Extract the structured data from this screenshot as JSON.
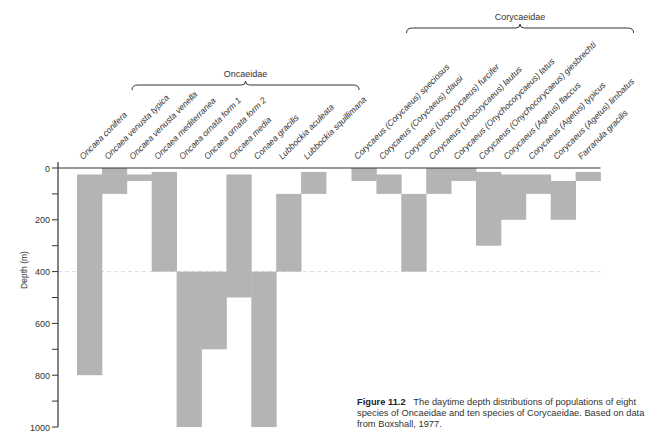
{
  "figure": {
    "number": "Figure 11.2",
    "caption": "The daytime depth distributions of populations of eight species of Oncaeidae and ten species of Corycaeidae. Based on data from Boxshall, 1977."
  },
  "colors": {
    "bar": "#b4b4b4",
    "axis": "#333333",
    "dashed_ref": "#dddddd"
  },
  "chart_data": {
    "type": "bar",
    "title": "The daytime depth distributions of populations of eight species of Oncaeidae and ten species of Corycaeidae",
    "xlabel": "",
    "ylabel": "Depth (m)",
    "ylim": [
      0,
      1000
    ],
    "y_inverted": true,
    "yticks": [
      0,
      200,
      400,
      600,
      800,
      1000
    ],
    "minor_yticks": [
      100,
      300,
      500,
      700,
      900
    ],
    "reference_line": {
      "depth": 400,
      "style": "dashed"
    },
    "grid": false,
    "legend": null,
    "groups": [
      {
        "name": "Oncaeidae",
        "from_index": 0,
        "to_index": 9
      },
      {
        "name": "Corycaeidae",
        "from_index": 10,
        "to_index": 19
      }
    ],
    "categories": [
      "Oncaea conifera",
      "Oncaea venusta typica",
      "Oncaea venusta venella",
      "Oncaea mediterranea",
      "Oncaea ornata form 1",
      "Oncaea ornata form 2",
      "Oncaea media",
      "Conaea gracilis",
      "Lubbockia aculeata",
      "Lubbockia squillimana",
      "Corycaeus (Corycaeus) speciosus",
      "Corycaeus (Corycaeus) clausi",
      "Corycaeus (Urocorycaeus) furcifer",
      "Corycaeus (Urocorycaeus) lautus",
      "Corycaeus (Onychocorycaeus) latus",
      "Corycaeus (Onychocorycaeus) giesbrechti",
      "Corycaeus (Agetus) flaccus",
      "Corycaeus (Agetus) typicus",
      "Corycaeus (Agetus) limbatus",
      "Farranula gracilis"
    ],
    "series": [
      {
        "name": "depth_top_m",
        "values": [
          25,
          0,
          25,
          15,
          400,
          400,
          25,
          400,
          100,
          15,
          0,
          25,
          100,
          0,
          0,
          15,
          25,
          25,
          50,
          15
        ]
      },
      {
        "name": "depth_bottom_m",
        "values": [
          800,
          100,
          50,
          400,
          1000,
          700,
          500,
          1000,
          400,
          100,
          50,
          100,
          400,
          100,
          50,
          300,
          200,
          100,
          200,
          50
        ]
      }
    ]
  }
}
